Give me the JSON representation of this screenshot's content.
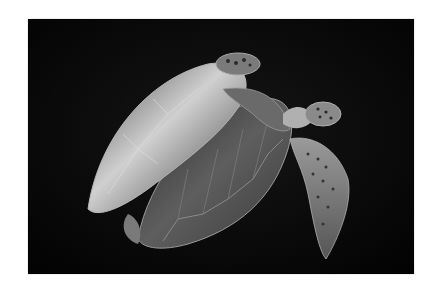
{
  "image": {
    "alt": "Two green sea turtles swimming against a black background",
    "subject": "sea turtles",
    "background_color": "#050505",
    "frame_color": "#ffffff",
    "shell_highlight": "#d8d8d8",
    "shell_mid": "#6a6a6a",
    "shell_dark": "#2a2a2a"
  }
}
